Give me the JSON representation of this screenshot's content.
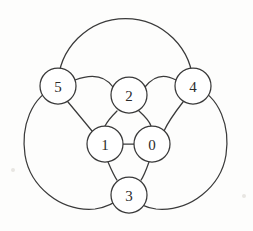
{
  "figure": {
    "title": "",
    "type": "graph-diagram",
    "width": 253,
    "height": 231,
    "background_color": "#fdfdfc",
    "stroke_color": "#3a3a3a",
    "node_fill_color": "#ffffff",
    "label_color": "#2b2b2b"
  },
  "nodes": [
    {
      "id": "0",
      "label": "0",
      "cx": 152,
      "cy": 144,
      "r": 18
    },
    {
      "id": "1",
      "label": "1",
      "cx": 105,
      "cy": 144,
      "r": 18
    },
    {
      "id": "2",
      "label": "2",
      "cx": 129,
      "cy": 95,
      "r": 18
    },
    {
      "id": "3",
      "label": "3",
      "cx": 129,
      "cy": 195,
      "r": 18
    },
    {
      "id": "4",
      "label": "4",
      "cx": 193,
      "cy": 86,
      "r": 18
    },
    {
      "id": "5",
      "label": "5",
      "cx": 58,
      "cy": 86,
      "r": 18
    }
  ],
  "edges": [
    {
      "from": "1",
      "to": "0",
      "style": "straight"
    },
    {
      "from": "2",
      "to": "1",
      "style": "curved"
    },
    {
      "from": "2",
      "to": "0",
      "style": "curved"
    },
    {
      "from": "1",
      "to": "3",
      "style": "curved"
    },
    {
      "from": "0",
      "to": "3",
      "style": "curved"
    },
    {
      "from": "5",
      "to": "2",
      "style": "arc"
    },
    {
      "from": "2",
      "to": "4",
      "style": "arc"
    },
    {
      "from": "5",
      "to": "1",
      "style": "straight"
    },
    {
      "from": "4",
      "to": "0",
      "style": "straight"
    },
    {
      "from": "5",
      "to": "4",
      "style": "outer-top-arc"
    },
    {
      "from": "5",
      "to": "3",
      "style": "outer-left-arc"
    },
    {
      "from": "4",
      "to": "3",
      "style": "outer-right-arc"
    }
  ],
  "outer_circles": [
    {
      "name": "top-outer-circle",
      "cx": 126,
      "cy": 73,
      "r": 60
    },
    {
      "name": "left-outer-circle",
      "cx": 82,
      "cy": 150,
      "r": 61
    },
    {
      "name": "right-outer-circle",
      "cx": 172,
      "cy": 150,
      "r": 61
    }
  ]
}
